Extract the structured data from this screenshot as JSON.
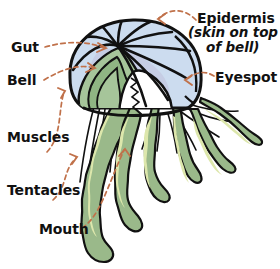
{
  "diagram": {
    "background_color": "#ffffff",
    "palette": {
      "outline": "#111111",
      "bell": "#ccdcef",
      "bell_shade": "#c3c9e2",
      "gut_green": "#a6c59a",
      "gut_green_dark": "#8fb583",
      "tentacle_edge": "#9ab98a",
      "tentacle_fill": "#dde7ac",
      "mouth_white": "#ffffff",
      "arrow": "#c0714a",
      "text": "#111111"
    },
    "labels": [
      {
        "id": "gut",
        "text": "Gut",
        "side": "left"
      },
      {
        "id": "bell",
        "text": "Bell",
        "side": "left"
      },
      {
        "id": "muscles",
        "text": "Muscles",
        "side": "left"
      },
      {
        "id": "tentacles",
        "text": "Tentacles",
        "side": "left"
      },
      {
        "id": "mouth",
        "text": "Mouth",
        "side": "left"
      },
      {
        "id": "epidermis",
        "text": "Epidermis",
        "side": "right"
      },
      {
        "id": "epidermis_note_line1",
        "text": "(skin on top",
        "side": "right"
      },
      {
        "id": "epidermis_note_line2",
        "text": "of bell)",
        "side": "right"
      },
      {
        "id": "eyespot",
        "text": "Eyespot",
        "side": "right"
      }
    ]
  }
}
